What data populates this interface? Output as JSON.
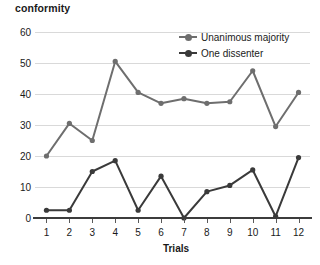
{
  "chart_data": {
    "type": "line",
    "title": "conformity",
    "xlabel": "Trials",
    "ylabel": "",
    "categories": [
      "1",
      "2",
      "3",
      "4",
      "5",
      "6",
      "7",
      "8",
      "9",
      "10",
      "11",
      "12"
    ],
    "x": [
      1,
      2,
      3,
      4,
      5,
      6,
      7,
      8,
      9,
      10,
      11,
      12
    ],
    "xlim": [
      0.5,
      12.5
    ],
    "ylim": [
      0,
      60
    ],
    "y_ticks": [
      0,
      10,
      20,
      30,
      40,
      50,
      60
    ],
    "grid": "horizontal",
    "legend_position": "top-right-inside",
    "series": [
      {
        "name": "Unanimous majority",
        "color": "#6e6e6e",
        "marker": "circle",
        "values": [
          20,
          30.5,
          25,
          50.5,
          40.5,
          37,
          38.5,
          37,
          37.5,
          47.5,
          29.5,
          40.5
        ]
      },
      {
        "name": "One dissenter",
        "color": "#3a3a3a",
        "marker": "circle",
        "values": [
          2.5,
          2.5,
          15,
          18.5,
          2.5,
          13.5,
          0,
          8.5,
          10.5,
          15.5,
          0.5,
          19.5
        ]
      }
    ]
  },
  "colors": {
    "unanimous_majority": "#6e6e6e",
    "one_dissenter": "#3a3a3a",
    "gridline": "#d9d9d9",
    "axis": "#3c3c3c",
    "text": "#1a1a1a",
    "background": "#ffffff"
  }
}
